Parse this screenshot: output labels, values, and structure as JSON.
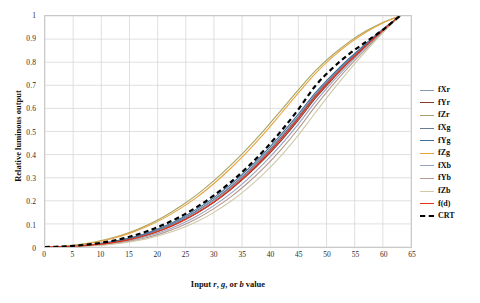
{
  "chart_data": {
    "type": "line",
    "title": "",
    "xlabel": "Input r, g, or b value",
    "ylabel": "Relative luminous output",
    "xlim": [
      0,
      65
    ],
    "ylim": [
      0,
      1
    ],
    "x_ticks": [
      0,
      5,
      10,
      15,
      20,
      25,
      30,
      35,
      40,
      45,
      50,
      55,
      60,
      65
    ],
    "y_ticks": [
      0,
      0.1,
      0.2,
      0.3,
      0.4,
      0.5,
      0.6,
      0.7,
      0.8,
      0.9,
      1
    ],
    "y_tick_labels": [
      "0",
      "0.1",
      "0.2",
      "0.3",
      "0.4",
      "0.5",
      "0.6",
      "0.7",
      "0.8",
      "0.9",
      "1"
    ],
    "x_tick_labels": [
      "0",
      "5",
      "10",
      "15",
      "20",
      "25",
      "30",
      "35",
      "40",
      "45",
      "50",
      "55",
      "60",
      "65"
    ],
    "grid": true,
    "legend_position": "right",
    "x_common": [
      0,
      3,
      6,
      9,
      12,
      15,
      18,
      21,
      24,
      27,
      30,
      33,
      36,
      39,
      42,
      45,
      48,
      51,
      54,
      57,
      60,
      63
    ],
    "series": [
      {
        "name": "fXr",
        "color": "#8496b0",
        "style": "solid",
        "width": 1.1,
        "values": [
          0,
          0.0015,
          0.005,
          0.011,
          0.021,
          0.035,
          0.055,
          0.081,
          0.114,
          0.154,
          0.202,
          0.258,
          0.322,
          0.394,
          0.474,
          0.561,
          0.655,
          0.735,
          0.808,
          0.875,
          0.94,
          1
        ]
      },
      {
        "name": "fYr",
        "color": "#843c2c",
        "style": "solid",
        "width": 1.1,
        "values": [
          0,
          0.0013,
          0.0044,
          0.0098,
          0.019,
          0.032,
          0.051,
          0.076,
          0.108,
          0.147,
          0.194,
          0.249,
          0.312,
          0.383,
          0.462,
          0.549,
          0.643,
          0.725,
          0.8,
          0.87,
          0.937,
          1
        ]
      },
      {
        "name": "fZr",
        "color": "#a6a464",
        "style": "solid",
        "width": 1.1,
        "values": [
          0,
          0.0032,
          0.0105,
          0.0225,
          0.04,
          0.063,
          0.093,
          0.13,
          0.175,
          0.227,
          0.287,
          0.354,
          0.428,
          0.508,
          0.594,
          0.68,
          0.762,
          0.83,
          0.888,
          0.935,
          0.972,
          1
        ]
      },
      {
        "name": "fXg",
        "color": "#6a7b94",
        "style": "solid",
        "width": 1.1,
        "values": [
          0,
          0.0016,
          0.0052,
          0.0115,
          0.0218,
          0.0365,
          0.0565,
          0.083,
          0.117,
          0.158,
          0.206,
          0.262,
          0.327,
          0.399,
          0.479,
          0.566,
          0.659,
          0.739,
          0.811,
          0.878,
          0.941,
          1
        ]
      },
      {
        "name": "fYg",
        "color": "#3f6e9c",
        "style": "solid",
        "width": 1.1,
        "values": [
          0,
          0.0017,
          0.0056,
          0.0123,
          0.0232,
          0.0386,
          0.0596,
          0.0873,
          0.1225,
          0.165,
          0.214,
          0.271,
          0.336,
          0.409,
          0.489,
          0.575,
          0.667,
          0.745,
          0.816,
          0.881,
          0.943,
          1
        ]
      },
      {
        "name": "fZg",
        "color": "#e8a33d",
        "style": "solid",
        "width": 1.1,
        "values": [
          0,
          0.0029,
          0.0096,
          0.0208,
          0.0372,
          0.059,
          0.0875,
          0.1228,
          0.166,
          0.216,
          0.275,
          0.341,
          0.414,
          0.494,
          0.58,
          0.667,
          0.751,
          0.821,
          0.881,
          0.93,
          0.97,
          1
        ]
      },
      {
        "name": "fXb",
        "color": "#9aa0c0",
        "style": "solid",
        "width": 1.1,
        "values": [
          0,
          0.0011,
          0.0038,
          0.0086,
          0.0166,
          0.0285,
          0.0452,
          0.0678,
          0.0972,
          0.134,
          0.179,
          0.232,
          0.294,
          0.365,
          0.444,
          0.532,
          0.628,
          0.714,
          0.792,
          0.864,
          0.934,
          1
        ]
      },
      {
        "name": "fYb",
        "color": "#b49a90",
        "style": "solid",
        "width": 1.1,
        "values": [
          0,
          0.0009,
          0.0032,
          0.0074,
          0.0145,
          0.0252,
          0.0404,
          0.0612,
          0.0885,
          0.123,
          0.166,
          0.217,
          0.277,
          0.346,
          0.424,
          0.512,
          0.609,
          0.699,
          0.781,
          0.857,
          0.931,
          1
        ]
      },
      {
        "name": "fZb",
        "color": "#cfc9a8",
        "style": "solid",
        "width": 1.1,
        "values": [
          0,
          0.0007,
          0.0026,
          0.0062,
          0.0123,
          0.0217,
          0.0352,
          0.0539,
          0.0787,
          0.11,
          0.15,
          0.198,
          0.255,
          0.321,
          0.397,
          0.484,
          0.581,
          0.676,
          0.765,
          0.848,
          0.927,
          1
        ]
      },
      {
        "name": "f(d)",
        "color": "#e03119",
        "style": "solid",
        "width": 1.2,
        "values": [
          0,
          0.0013,
          0.0044,
          0.0099,
          0.019,
          0.0322,
          0.0508,
          0.0757,
          0.1077,
          0.1474,
          0.1952,
          0.2513,
          0.3158,
          0.3886,
          0.4692,
          0.5569,
          0.6506,
          0.7302,
          0.8036,
          0.8718,
          0.9375,
          1
        ]
      },
      {
        "name": "CRT",
        "color": "#000000",
        "style": "dashed",
        "width": 2.2,
        "values": [
          0,
          0.002,
          0.0068,
          0.0148,
          0.0271,
          0.0443,
          0.067,
          0.0958,
          0.1312,
          0.1736,
          0.2234,
          0.281,
          0.3467,
          0.4209,
          0.5038,
          0.5958,
          0.697,
          0.7726,
          0.835,
          0.888,
          0.94,
          1
        ]
      }
    ]
  },
  "legend": {
    "items": [
      {
        "label": "fXr",
        "color": "#8496b0",
        "style": "solid"
      },
      {
        "label": "fYr",
        "color": "#843c2c",
        "style": "solid"
      },
      {
        "label": "fZr",
        "color": "#a6a464",
        "style": "solid"
      },
      {
        "label": "fXg",
        "color": "#6a7b94",
        "style": "solid"
      },
      {
        "label": "fYg",
        "color": "#3f6e9c",
        "style": "solid"
      },
      {
        "label": "fZg",
        "color": "#e8a33d",
        "style": "solid"
      },
      {
        "label": "fXb",
        "color": "#9aa0c0",
        "style": "solid"
      },
      {
        "label": "fYb",
        "color": "#b49a90",
        "style": "solid"
      },
      {
        "label": "fZb",
        "color": "#cfc9a8",
        "style": "solid"
      },
      {
        "label": "f(d)",
        "color": "#e03119",
        "style": "solid"
      },
      {
        "label": "CRT",
        "color": "#000000",
        "style": "dashed"
      }
    ]
  },
  "axes": {
    "x_title_prefix": "Input ",
    "x_title_r": "r",
    "x_title_sep1": ", ",
    "x_title_g": "g",
    "x_title_sep2": ", or ",
    "x_title_b": "b",
    "x_title_suffix": " value",
    "y_title": "Relative luminous output"
  },
  "colors": {
    "grid": "#d8d8d8",
    "frame": "#c9c9c9",
    "tick_text": "#2b2b2b",
    "title_text": "#111111",
    "background": "#ffffff"
  }
}
